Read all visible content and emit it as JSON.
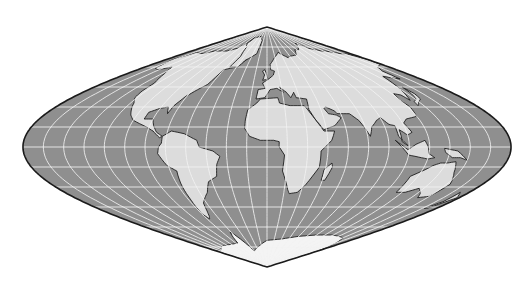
{
  "map": {
    "title": "World map — sinusoidal projection",
    "projection": "sinusoidal",
    "center": {
      "x": 267,
      "y": 147
    },
    "half_width": 244,
    "half_height": 120,
    "graticule_step_deg": 15,
    "colors": {
      "background": "#ffffff",
      "ocean": "#8f8f8f",
      "land": "#dcdcdc",
      "land_edge": "#1e1e1e",
      "graticule": "#f2f2f2",
      "outline": "#1a1a1a",
      "antarctica": "#f4f4f4"
    },
    "continents": [
      {
        "name": "North America",
        "pts": [
          [
            -168,
            66
          ],
          [
            -160,
            71
          ],
          [
            -140,
            70
          ],
          [
            -125,
            72
          ],
          [
            -95,
            72
          ],
          [
            -80,
            74
          ],
          [
            -65,
            82
          ],
          [
            -30,
            83
          ],
          [
            -20,
            76
          ],
          [
            -45,
            60
          ],
          [
            -60,
            58
          ],
          [
            -64,
            47
          ],
          [
            -70,
            43
          ],
          [
            -76,
            38
          ],
          [
            -80,
            31
          ],
          [
            -81,
            25
          ],
          [
            -84,
            30
          ],
          [
            -90,
            29
          ],
          [
            -97,
            26
          ],
          [
            -97,
            21
          ],
          [
            -90,
            21
          ],
          [
            -87,
            16
          ],
          [
            -83,
            11
          ],
          [
            -78,
            8
          ],
          [
            -80,
            7
          ],
          [
            -86,
            12
          ],
          [
            -92,
            15
          ],
          [
            -105,
            20
          ],
          [
            -110,
            24
          ],
          [
            -115,
            30
          ],
          [
            -117,
            33
          ],
          [
            -122,
            37
          ],
          [
            -124,
            42
          ],
          [
            -124,
            48
          ],
          [
            -132,
            55
          ],
          [
            -140,
            60
          ],
          [
            -152,
            58
          ],
          [
            -160,
            59
          ],
          [
            -165,
            63
          ]
        ]
      },
      {
        "name": "South America",
        "pts": [
          [
            -78,
            8
          ],
          [
            -72,
            12
          ],
          [
            -62,
            10
          ],
          [
            -52,
            5
          ],
          [
            -50,
            0
          ],
          [
            -40,
            -3
          ],
          [
            -35,
            -7
          ],
          [
            -38,
            -13
          ],
          [
            -40,
            -22
          ],
          [
            -48,
            -26
          ],
          [
            -53,
            -34
          ],
          [
            -58,
            -38
          ],
          [
            -63,
            -42
          ],
          [
            -66,
            -48
          ],
          [
            -69,
            -52
          ],
          [
            -72,
            -54
          ],
          [
            -75,
            -50
          ],
          [
            -73,
            -40
          ],
          [
            -72,
            -30
          ],
          [
            -70,
            -18
          ],
          [
            -76,
            -14
          ],
          [
            -81,
            -5
          ],
          [
            -80,
            0
          ],
          [
            -78,
            3
          ]
        ]
      },
      {
        "name": "Africa",
        "pts": [
          [
            -17,
            21
          ],
          [
            -16,
            28
          ],
          [
            -9,
            33
          ],
          [
            -6,
            36
          ],
          [
            10,
            37
          ],
          [
            11,
            33
          ],
          [
            20,
            31
          ],
          [
            32,
            31
          ],
          [
            34,
            28
          ],
          [
            43,
            12
          ],
          [
            51,
            12
          ],
          [
            48,
            5
          ],
          [
            40,
            -3
          ],
          [
            40,
            -15
          ],
          [
            35,
            -24
          ],
          [
            32,
            -29
          ],
          [
            27,
            -34
          ],
          [
            20,
            -35
          ],
          [
            18,
            -32
          ],
          [
            12,
            -18
          ],
          [
            13,
            -6
          ],
          [
            9,
            0
          ],
          [
            9,
            4
          ],
          [
            5,
            5
          ],
          [
            -5,
            5
          ],
          [
            -13,
            8
          ],
          [
            -17,
            14
          ]
        ]
      },
      {
        "name": "Eurasia",
        "pts": [
          [
            -10,
            36
          ],
          [
            -9,
            43
          ],
          [
            -2,
            44
          ],
          [
            -5,
            48
          ],
          [
            2,
            51
          ],
          [
            8,
            54
          ],
          [
            10,
            57
          ],
          [
            5,
            58
          ],
          [
            5,
            62
          ],
          [
            14,
            67
          ],
          [
            25,
            71
          ],
          [
            40,
            67
          ],
          [
            44,
            68
          ],
          [
            60,
            69
          ],
          [
            70,
            73
          ],
          [
            80,
            73
          ],
          [
            100,
            78
          ],
          [
            112,
            74
          ],
          [
            130,
            72
          ],
          [
            140,
            72
          ],
          [
            160,
            70
          ],
          [
            170,
            70
          ],
          [
            180,
            66
          ],
          [
            178,
            62
          ],
          [
            163,
            60
          ],
          [
            156,
            57
          ],
          [
            156,
            51
          ],
          [
            142,
            53
          ],
          [
            135,
            43
          ],
          [
            129,
            35
          ],
          [
            127,
            39
          ],
          [
            122,
            40
          ],
          [
            120,
            35
          ],
          [
            122,
            30
          ],
          [
            120,
            23
          ],
          [
            110,
            21
          ],
          [
            106,
            18
          ],
          [
            109,
            11
          ],
          [
            105,
            9
          ],
          [
            100,
            13
          ],
          [
            100,
            4
          ],
          [
            104,
            1
          ],
          [
            98,
            8
          ],
          [
            98,
            16
          ],
          [
            94,
            17
          ],
          [
            90,
            22
          ],
          [
            86,
            20
          ],
          [
            80,
            15
          ],
          [
            77,
            8
          ],
          [
            72,
            20
          ],
          [
            67,
            25
          ],
          [
            57,
            25
          ],
          [
            56,
            27
          ],
          [
            50,
            30
          ],
          [
            48,
            29
          ],
          [
            50,
            25
          ],
          [
            56,
            24
          ],
          [
            59,
            22
          ],
          [
            52,
            16
          ],
          [
            43,
            13
          ],
          [
            38,
            21
          ],
          [
            35,
            28
          ],
          [
            36,
            36
          ],
          [
            27,
            37
          ],
          [
            26,
            41
          ],
          [
            22,
            37
          ],
          [
            19,
            41
          ],
          [
            13,
            45
          ],
          [
            16,
            41
          ],
          [
            10,
            44
          ],
          [
            3,
            43
          ],
          [
            -2,
            37
          ]
        ]
      },
      {
        "name": "Australia",
        "pts": [
          [
            114,
            -22
          ],
          [
            115,
            -34
          ],
          [
            123,
            -34
          ],
          [
            131,
            -31
          ],
          [
            138,
            -35
          ],
          [
            141,
            -38
          ],
          [
            150,
            -37
          ],
          [
            153,
            -28
          ],
          [
            146,
            -19
          ],
          [
            142,
            -11
          ],
          [
            136,
            -12
          ],
          [
            131,
            -12
          ],
          [
            126,
            -14
          ],
          [
            122,
            -17
          ]
        ]
      },
      {
        "name": "Greenland",
        "pts": [
          [
            -55,
            60
          ],
          [
            -43,
            60
          ],
          [
            -38,
            65
          ],
          [
            -22,
            70
          ],
          [
            -20,
            80
          ],
          [
            -35,
            83
          ],
          [
            -60,
            82
          ],
          [
            -70,
            78
          ],
          [
            -58,
            75
          ],
          [
            -52,
            68
          ]
        ]
      },
      {
        "name": "Antarctica",
        "pts": [
          [
            -180,
            -78
          ],
          [
            -150,
            -77
          ],
          [
            -120,
            -74
          ],
          [
            -90,
            -73
          ],
          [
            -70,
            -72
          ],
          [
            -62,
            -64
          ],
          [
            -58,
            -66
          ],
          [
            -45,
            -78
          ],
          [
            -20,
            -74
          ],
          [
            0,
            -70
          ],
          [
            30,
            -69
          ],
          [
            60,
            -67
          ],
          [
            90,
            -66
          ],
          [
            120,
            -66
          ],
          [
            150,
            -68
          ],
          [
            165,
            -72
          ],
          [
            180,
            -78
          ],
          [
            180,
            -90
          ],
          [
            -180,
            -90
          ]
        ]
      },
      {
        "name": "Madagascar",
        "pts": [
          [
            44,
            -25
          ],
          [
            47,
            -25
          ],
          [
            50,
            -15
          ],
          [
            49,
            -12
          ],
          [
            44,
            -17
          ]
        ]
      },
      {
        "name": "Japan",
        "pts": [
          [
            130,
            31
          ],
          [
            135,
            34
          ],
          [
            140,
            36
          ],
          [
            142,
            40
          ],
          [
            141,
            45
          ],
          [
            139,
            40
          ],
          [
            136,
            36
          ],
          [
            131,
            34
          ]
        ]
      },
      {
        "name": "Great Britain",
        "pts": [
          [
            -5,
            50
          ],
          [
            1,
            51
          ],
          [
            0,
            54
          ],
          [
            -3,
            58
          ],
          [
            -6,
            57
          ],
          [
            -3,
            54
          ]
        ]
      },
      {
        "name": "Indonesia",
        "pts": [
          [
            95,
            5
          ],
          [
            105,
            -6
          ],
          [
            115,
            -8
          ],
          [
            120,
            -9
          ],
          [
            125,
            -8
          ],
          [
            120,
            -5
          ],
          [
            119,
            0
          ],
          [
            117,
            5
          ],
          [
            110,
            2
          ],
          [
            104,
            -2
          ]
        ]
      },
      {
        "name": "New Guinea",
        "pts": [
          [
            131,
            -1
          ],
          [
            141,
            -3
          ],
          [
            150,
            -10
          ],
          [
            144,
            -8
          ],
          [
            138,
            -8
          ],
          [
            132,
            -4
          ]
        ]
      },
      {
        "name": "New Zealand",
        "pts": [
          [
            172,
            -34
          ],
          [
            178,
            -38
          ],
          [
            174,
            -42
          ],
          [
            170,
            -46
          ],
          [
            167,
            -46
          ],
          [
            172,
            -41
          ]
        ]
      }
    ]
  }
}
